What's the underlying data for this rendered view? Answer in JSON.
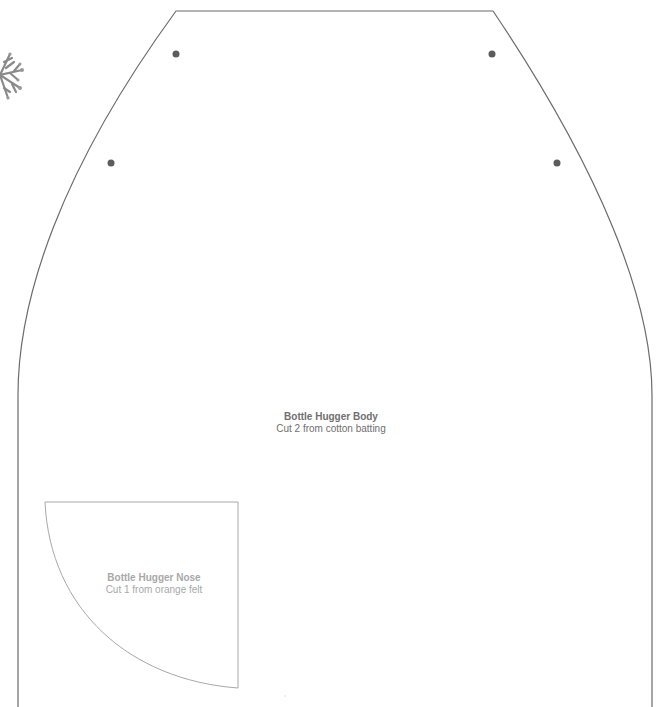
{
  "pieces": [
    {
      "name": "Bottle Hugger Body",
      "instruction": "Cut 2 from cotton batting",
      "outline_color": "#6b6b6c",
      "marker_dots": [
        {
          "x": 176,
          "y": 54
        },
        {
          "x": 492,
          "y": 54
        },
        {
          "x": 111,
          "y": 163
        },
        {
          "x": 557,
          "y": 163
        }
      ]
    },
    {
      "name": "Bottle Hugger Nose",
      "instruction": "Cut 1 from orange felt",
      "outline_color": "#a8a8a9"
    }
  ],
  "colors": {
    "body_outline": "#6b6b6c",
    "body_text": "#6f6f70",
    "nose_outline": "#a8a8a9",
    "nose_text": "#a8a8a9",
    "dot": "#5c5c5d"
  },
  "decorations": [
    "snowflake-fragment"
  ]
}
